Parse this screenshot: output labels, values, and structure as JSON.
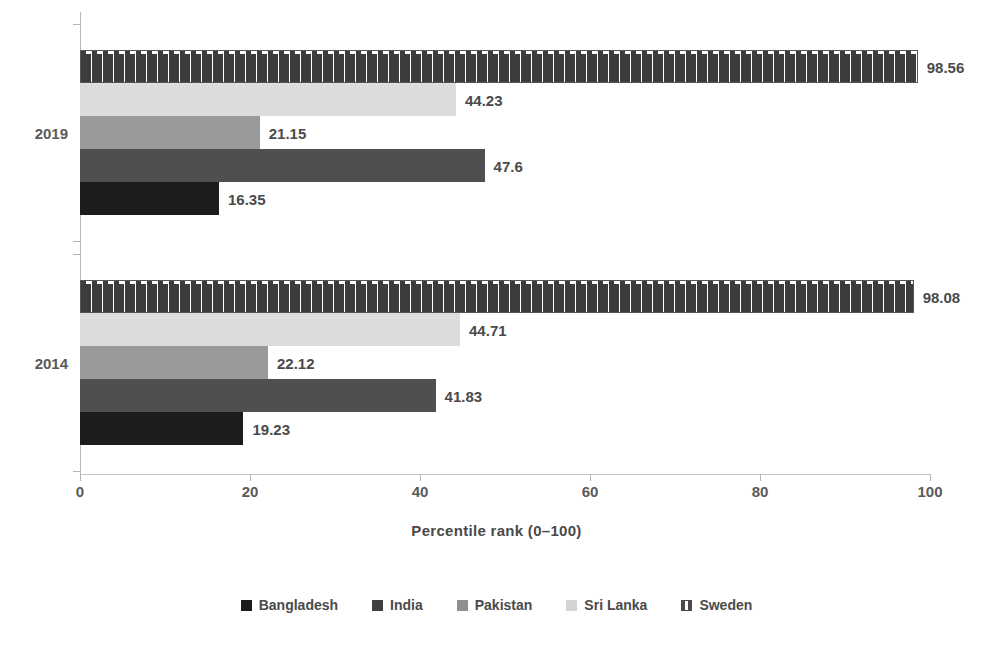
{
  "chart_data": {
    "type": "bar",
    "orientation": "horizontal",
    "title": "",
    "subtitle": "",
    "xlabel": "Percentile rank (0–100)",
    "ylabel": "",
    "xlim": [
      0,
      100
    ],
    "xticks": [
      0,
      20,
      40,
      60,
      80,
      100
    ],
    "xtick_labels": [
      "0",
      "20",
      "40",
      "60",
      "80",
      "100"
    ],
    "grid": false,
    "legend_position": "bottom",
    "categories": [
      "2019",
      "2014"
    ],
    "series": [
      {
        "name": "Bangladesh",
        "color": "#1c1c1c",
        "values": [
          16.35,
          19.23
        ],
        "labels": [
          "16.35",
          "19.23"
        ]
      },
      {
        "name": "India",
        "color": "#4f4f4f",
        "values": [
          47.6,
          41.83
        ],
        "labels": [
          "47.6",
          "41.83"
        ]
      },
      {
        "name": "Pakistan",
        "color": "#9a9a9a",
        "values": [
          21.15,
          22.12
        ],
        "labels": [
          "21.15",
          "22.12"
        ]
      },
      {
        "name": "Sri Lanka",
        "color": "#dcdcdc",
        "values": [
          44.23,
          44.71
        ],
        "labels": [
          "44.23",
          "44.71"
        ]
      },
      {
        "name": "Sweden",
        "color": "#ffffff",
        "pattern": "dashed-hatch",
        "values": [
          98.56,
          98.08
        ],
        "labels": [
          "98.56",
          "98.08"
        ]
      }
    ]
  },
  "axis": {
    "x_title": "Percentile rank (0–100)",
    "tick_labels": [
      "0",
      "20",
      "40",
      "60",
      "80",
      "100"
    ]
  },
  "groups": [
    {
      "label": "2019"
    },
    {
      "label": "2014"
    }
  ],
  "legend": {
    "items": [
      {
        "label": "Bangladesh",
        "swatch": "legend-swatch-bangladesh"
      },
      {
        "label": "India",
        "swatch": "legend-swatch-india"
      },
      {
        "label": "Pakistan",
        "swatch": "legend-swatch-pakistan"
      },
      {
        "label": "Sri Lanka",
        "swatch": "legend-swatch-srilanka"
      },
      {
        "label": "Sweden",
        "swatch": "legend-swatch-sweden"
      }
    ]
  },
  "colors": {
    "bangladesh": "#1c1c1c",
    "india": "#4f4f4f",
    "pakistan": "#9a9a9a",
    "sri_lanka": "#dcdcdc",
    "sweden": "#ffffff",
    "text": "#4a4a4a",
    "axis": "#b8b8b8",
    "background": "#ffffff"
  }
}
